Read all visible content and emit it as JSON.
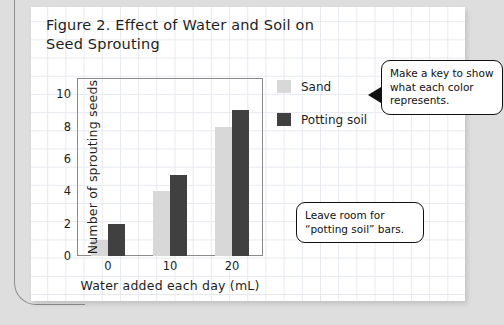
{
  "chart_data": {
    "type": "bar",
    "title": "Figure 2. Effect of Water and Soil on Seed Sprouting",
    "xlabel": "Water added each day (mL)",
    "ylabel": "Number of sprouting seeds",
    "categories": [
      "0",
      "10",
      "20"
    ],
    "series": [
      {
        "name": "Sand",
        "color": "#d8d8d8",
        "values": [
          1,
          4,
          8
        ]
      },
      {
        "name": "Potting soil",
        "color": "#404040",
        "values": [
          2,
          5,
          9
        ]
      }
    ],
    "ylim": [
      0,
      11
    ],
    "yticks": [
      "0",
      "2",
      "4",
      "6",
      "8",
      "10"
    ],
    "ytick_values": [
      0,
      2,
      4,
      6,
      8,
      10
    ],
    "grid": false,
    "legend_position": "right"
  },
  "annotations": [
    {
      "id": "callout-key",
      "text": "Make a key to show what each color represents.",
      "has_arrow": true
    },
    {
      "id": "callout-room",
      "text": "Leave room for “potting soil” bars.",
      "has_arrow": false
    }
  ],
  "colors": {
    "sand": "#d8d8d8",
    "potting_soil": "#404040",
    "page_background": "#dedede",
    "grid_line": "#e6e9ee"
  }
}
